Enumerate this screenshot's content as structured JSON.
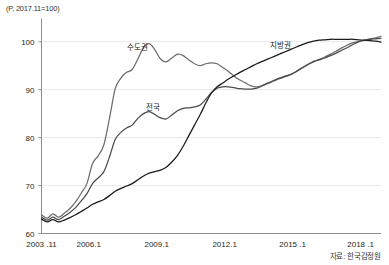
{
  "unit_note": "(P, 2017.11=100)",
  "source_note": "자료: 한국감정원",
  "chart_data": {
    "type": "line",
    "title": "",
    "subtitle": "",
    "xlabel": "",
    "ylabel": "(P, 2017.11=100)",
    "ylim": [
      60,
      104
    ],
    "yticks": [
      60,
      70,
      80,
      90,
      100
    ],
    "ytick_labels": [
      "60",
      "70",
      "80",
      "90",
      "100"
    ],
    "grid": true,
    "grid_axis": "y",
    "legend_position": "inline-annotations",
    "xlim": [
      2003.917,
      2018.9
    ],
    "xticks": [
      2003.917,
      2006.0,
      2009.0,
      2012.0,
      2015.0,
      2018.0
    ],
    "xtick_labels": [
      "2003 .11",
      "2006.1",
      "2009.1",
      "2012.1",
      "2015 .1",
      "2018 .1"
    ],
    "annotations": [
      {
        "text": "수도권",
        "x": 2008.15,
        "y": 99.2
      },
      {
        "text": "전국",
        "x": 2008.85,
        "y": 86.6
      },
      {
        "text": "지방권",
        "x": 2014.45,
        "y": 99.6
      }
    ],
    "series": [
      {
        "name": "수도권",
        "color": "#6d6d6d",
        "x": [
          2003.917,
          2004.17,
          2004.42,
          2004.67,
          2004.92,
          2005.17,
          2005.42,
          2005.67,
          2005.92,
          2006.17,
          2006.42,
          2006.67,
          2006.92,
          2007.17,
          2007.42,
          2007.67,
          2007.92,
          2008.17,
          2008.42,
          2008.67,
          2008.92,
          2009.17,
          2009.42,
          2009.67,
          2009.92,
          2010.17,
          2010.42,
          2010.67,
          2010.92,
          2011.17,
          2011.42,
          2011.67,
          2011.92,
          2012.17,
          2012.42,
          2012.67,
          2012.92,
          2013.17,
          2013.42,
          2013.67,
          2013.92,
          2014.17,
          2014.42,
          2014.67,
          2014.92,
          2015.17,
          2015.42,
          2015.67,
          2015.92,
          2016.17,
          2016.42,
          2016.67,
          2016.92,
          2017.17,
          2017.42,
          2017.67,
          2017.92,
          2018.17,
          2018.42,
          2018.67,
          2018.9
        ],
        "y": [
          63.9,
          63.2,
          64.1,
          63.4,
          64.2,
          65.2,
          66.6,
          68.4,
          70.4,
          74.6,
          76.2,
          78.5,
          84.1,
          90.2,
          92.4,
          93.6,
          94.2,
          96.4,
          98.8,
          99.6,
          98.3,
          96.4,
          95.8,
          96.6,
          97.4,
          97.1,
          96.2,
          95.4,
          95.0,
          95.4,
          95.6,
          95.4,
          94.6,
          93.8,
          92.8,
          92.0,
          91.4,
          90.8,
          90.6,
          90.9,
          91.3,
          91.8,
          92.3,
          92.7,
          93.1,
          93.8,
          94.6,
          95.3,
          95.9,
          96.3,
          96.8,
          97.4,
          98.0,
          98.7,
          99.3,
          99.8,
          100.0,
          100.3,
          100.6,
          100.8,
          101.1
        ]
      },
      {
        "name": "전국",
        "color": "#4a4a4a",
        "x": [
          2003.917,
          2004.17,
          2004.42,
          2004.67,
          2004.92,
          2005.17,
          2005.42,
          2005.67,
          2005.92,
          2006.17,
          2006.42,
          2006.67,
          2006.92,
          2007.17,
          2007.42,
          2007.67,
          2007.92,
          2008.17,
          2008.42,
          2008.67,
          2008.92,
          2009.17,
          2009.42,
          2009.67,
          2009.92,
          2010.17,
          2010.42,
          2010.67,
          2010.92,
          2011.17,
          2011.42,
          2011.67,
          2011.92,
          2012.17,
          2012.42,
          2012.67,
          2012.92,
          2013.17,
          2013.42,
          2013.67,
          2013.92,
          2014.17,
          2014.42,
          2014.67,
          2014.92,
          2015.17,
          2015.42,
          2015.67,
          2015.92,
          2016.17,
          2016.42,
          2016.67,
          2016.92,
          2017.17,
          2017.42,
          2017.67,
          2017.92,
          2018.17,
          2018.42,
          2018.67,
          2018.9
        ],
        "y": [
          63.4,
          62.8,
          63.4,
          62.9,
          63.6,
          64.4,
          65.4,
          66.8,
          68.3,
          70.4,
          71.6,
          72.9,
          76.0,
          79.6,
          81.1,
          82.0,
          82.6,
          84.0,
          85.0,
          85.4,
          84.8,
          84.1,
          83.9,
          84.7,
          85.6,
          86.1,
          86.2,
          86.4,
          86.8,
          88.0,
          89.4,
          90.3,
          90.6,
          90.6,
          90.4,
          90.2,
          90.1,
          90.1,
          90.3,
          90.8,
          91.4,
          91.9,
          92.4,
          92.8,
          93.2,
          93.8,
          94.5,
          95.2,
          95.8,
          96.2,
          96.6,
          97.1,
          97.6,
          98.2,
          98.8,
          99.4,
          100.0,
          100.3,
          100.5,
          100.6,
          100.7
        ]
      },
      {
        "name": "지방권",
        "color": "#1a1a1a",
        "x": [
          2003.917,
          2004.17,
          2004.42,
          2004.67,
          2004.92,
          2005.17,
          2005.42,
          2005.67,
          2005.92,
          2006.17,
          2006.42,
          2006.67,
          2006.92,
          2007.17,
          2007.42,
          2007.67,
          2007.92,
          2008.17,
          2008.42,
          2008.67,
          2008.92,
          2009.17,
          2009.42,
          2009.67,
          2009.92,
          2010.17,
          2010.42,
          2010.67,
          2010.92,
          2011.17,
          2011.42,
          2011.67,
          2011.92,
          2012.17,
          2012.42,
          2012.67,
          2012.92,
          2013.17,
          2013.42,
          2013.67,
          2013.92,
          2014.17,
          2014.42,
          2014.67,
          2014.92,
          2015.17,
          2015.42,
          2015.67,
          2015.92,
          2016.17,
          2016.42,
          2016.67,
          2016.92,
          2017.17,
          2017.42,
          2017.67,
          2017.92,
          2018.17,
          2018.42,
          2018.67,
          2018.9
        ],
        "y": [
          63.0,
          62.4,
          62.9,
          62.4,
          62.8,
          63.3,
          63.9,
          64.6,
          65.3,
          66.1,
          66.6,
          67.1,
          67.9,
          68.8,
          69.4,
          69.9,
          70.4,
          71.2,
          72.0,
          72.6,
          72.9,
          73.2,
          73.8,
          74.9,
          76.3,
          78.2,
          80.4,
          82.6,
          84.8,
          87.2,
          89.3,
          90.6,
          91.4,
          92.2,
          92.9,
          93.6,
          94.2,
          94.8,
          95.4,
          95.9,
          96.4,
          96.9,
          97.4,
          97.9,
          98.4,
          98.9,
          99.4,
          99.8,
          100.1,
          100.3,
          100.4,
          100.5,
          100.5,
          100.5,
          100.5,
          100.5,
          100.4,
          100.3,
          100.2,
          100.1,
          99.9
        ]
      }
    ]
  }
}
